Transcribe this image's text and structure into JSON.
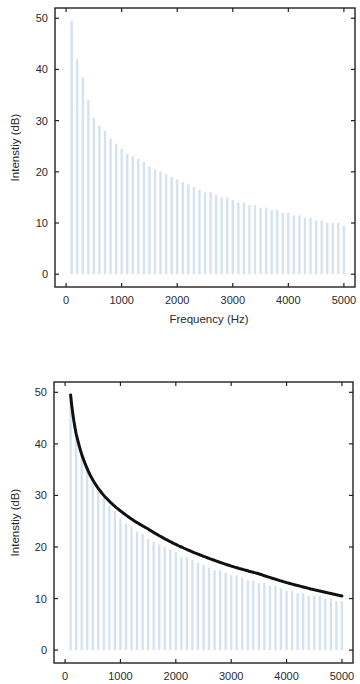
{
  "chart_data": [
    {
      "type": "bar",
      "title": "",
      "xlabel": "Frequency (Hz)",
      "ylabel": "Intenstiy (dB)",
      "xlim": [
        -200,
        5200
      ],
      "ylim": [
        -2.5,
        52
      ],
      "xticks": [
        0,
        1000,
        2000,
        3000,
        4000,
        5000
      ],
      "yticks": [
        0,
        10,
        20,
        30,
        40,
        50
      ],
      "grid": false,
      "legend": null,
      "bar_color": "#d4e3ef",
      "x": [
        100,
        200,
        300,
        400,
        500,
        600,
        700,
        800,
        900,
        1000,
        1100,
        1200,
        1300,
        1400,
        1500,
        1600,
        1700,
        1800,
        1900,
        2000,
        2100,
        2200,
        2300,
        2400,
        2500,
        2600,
        2700,
        2800,
        2900,
        3000,
        3100,
        3200,
        3300,
        3400,
        3500,
        3600,
        3700,
        3800,
        3900,
        4000,
        4100,
        4200,
        4300,
        4400,
        4500,
        4600,
        4700,
        4800,
        4900,
        5000
      ],
      "values": [
        49.5,
        42,
        38.5,
        34,
        30.5,
        29,
        28,
        26.5,
        25.5,
        24.5,
        23.5,
        23,
        22.5,
        22,
        21,
        20.5,
        20,
        19.5,
        19,
        18.5,
        18,
        17.5,
        17,
        16.5,
        16,
        16,
        15.5,
        15,
        15,
        14.5,
        14,
        14,
        13.5,
        13.5,
        13,
        13,
        12.5,
        12.5,
        12,
        12,
        11.5,
        11.5,
        11,
        11,
        10.5,
        10.5,
        10,
        10,
        10,
        9.5
      ]
    },
    {
      "type": "bar",
      "title": "",
      "xlabel": "",
      "ylabel": "Intenstiy (dB)",
      "xlim": [
        -200,
        5200
      ],
      "ylim": [
        -2.5,
        52
      ],
      "xticks": [
        0,
        1000,
        2000,
        3000,
        4000,
        5000
      ],
      "yticks": [
        0,
        10,
        20,
        30,
        40,
        50
      ],
      "grid": false,
      "legend": null,
      "bar_color": "#d4e3ef",
      "curve_color": "#111111",
      "x": [
        100,
        200,
        300,
        400,
        500,
        600,
        700,
        800,
        900,
        1000,
        1100,
        1200,
        1300,
        1400,
        1500,
        1600,
        1700,
        1800,
        1900,
        2000,
        2100,
        2200,
        2300,
        2400,
        2500,
        2600,
        2700,
        2800,
        2900,
        3000,
        3100,
        3200,
        3300,
        3400,
        3500,
        3600,
        3700,
        3800,
        3900,
        4000,
        4100,
        4200,
        4300,
        4400,
        4500,
        4600,
        4700,
        4800,
        4900,
        5000
      ],
      "values": [
        49,
        42,
        38,
        35,
        32.5,
        31,
        29.5,
        28,
        27,
        25.5,
        24.5,
        24,
        23,
        22.5,
        21.5,
        21,
        20.5,
        20,
        19.5,
        19,
        18,
        18,
        17.5,
        17,
        16.5,
        16,
        15.5,
        15.5,
        15,
        14.5,
        14.5,
        14,
        13.5,
        13.5,
        13,
        13,
        12.5,
        12.5,
        12,
        11.5,
        11.5,
        11,
        11,
        10.5,
        10.5,
        10.5,
        10,
        10,
        9.5,
        9.5
      ],
      "envelope_curve": {
        "description": "Smooth spectral envelope drawn over bar tops",
        "x": [
          100,
          200,
          300,
          500,
          700,
          1000,
          1500,
          2000,
          2500,
          3000,
          3500,
          4000,
          4500,
          5000
        ],
        "y": [
          49.5,
          42,
          38,
          33,
          30,
          27,
          23.5,
          20.5,
          18.2,
          16.3,
          14.8,
          13.1,
          11.7,
          10.5
        ]
      }
    }
  ]
}
